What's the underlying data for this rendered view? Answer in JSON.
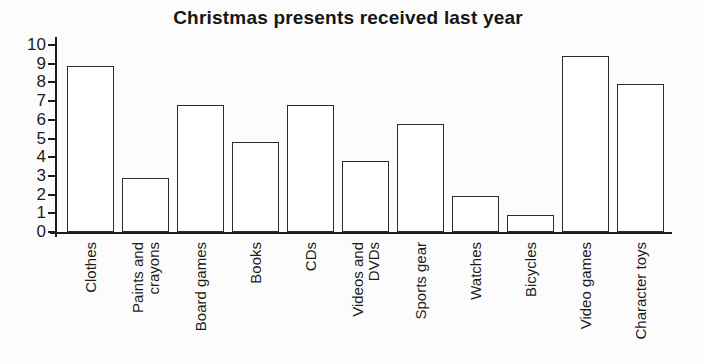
{
  "page": {
    "background": "#fcfcfc"
  },
  "chart_data": {
    "type": "bar",
    "title": "Christmas presents received last year",
    "categories": [
      "Clothes",
      "Paints and\ncrayons",
      "Board games",
      "Books",
      "CDs",
      "Videos and\nDVDs",
      "Sports gear",
      "Watches",
      "Bicycles",
      "Video games",
      "Character toys"
    ],
    "values": [
      8.9,
      2.9,
      6.8,
      4.8,
      6.8,
      3.8,
      5.8,
      1.9,
      0.9,
      9.4,
      7.9
    ],
    "xlabel": "",
    "ylabel": "",
    "ylim": [
      0,
      10
    ],
    "yticks": [
      0,
      1,
      2,
      3,
      4,
      5,
      6,
      7,
      8,
      9,
      10
    ],
    "grid": false,
    "legend": "none",
    "bar_fill": "#ffffff",
    "bar_border": "#2b2b2b",
    "axis_color": "#1c1c1c",
    "text_color": "#1c1c1c",
    "background": "#fcfcfc"
  }
}
